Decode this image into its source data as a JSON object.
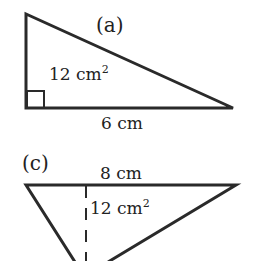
{
  "figures": [
    {
      "id": "a",
      "label": "(a)",
      "area_label": "12 cm",
      "area_exp": "2",
      "base_label": "6 cm"
    },
    {
      "id": "c",
      "label": "(c)",
      "area_label": "12 cm",
      "area_exp": "2",
      "base_label": "8 cm"
    }
  ],
  "colors": {
    "stroke": "#2a2a2a",
    "background": "#ffffff"
  }
}
